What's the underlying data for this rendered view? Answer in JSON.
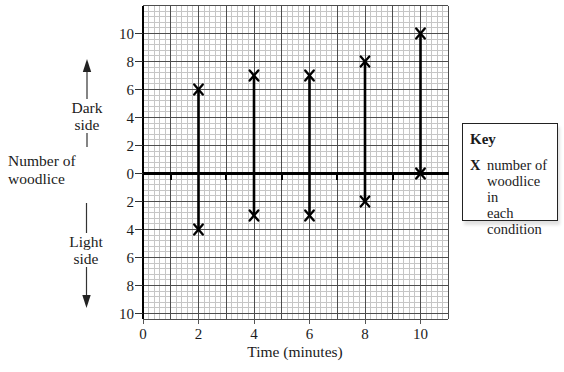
{
  "labels": {
    "y_axis_title_line1": "Number of",
    "y_axis_title_line2": "woodlice",
    "dark_line1": "Dark",
    "dark_line2": "side",
    "light_line1": "Light",
    "light_line2": "side",
    "x_axis_title": "Time (minutes)"
  },
  "key": {
    "title": "Key",
    "symbol": "X",
    "label": "number of woodlice in each condition",
    "label_lines": [
      "number of",
      "woodlice in",
      "each",
      "condition"
    ]
  },
  "chart_data": {
    "type": "scatter",
    "marker": "X",
    "xlabel": "Time (minutes)",
    "ylabel": "Number of woodlice",
    "axis_direction_labels": {
      "up": "Dark side",
      "down": "Light side"
    },
    "x_tick_labels": [
      "0",
      "2",
      "4",
      "6",
      "8",
      "10"
    ],
    "x_tick_values": [
      0,
      2,
      4,
      6,
      8,
      10
    ],
    "y_tick_labels": [
      "10",
      "8",
      "6",
      "4",
      "2",
      "0",
      "2",
      "4",
      "6",
      "8",
      "10"
    ],
    "y_tick_values": [
      10,
      8,
      6,
      4,
      2,
      0,
      -2,
      -4,
      -6,
      -8,
      -10
    ],
    "x_minor_axis_ticks": [
      1,
      3,
      5,
      7,
      9
    ],
    "xlim": [
      0,
      11
    ],
    "ylim": [
      -10.4,
      12
    ],
    "grid": "fine graph paper; major lines every 1 minute and every 2 woodlice",
    "legend_position": "right",
    "x": [
      2,
      4,
      6,
      8,
      10
    ],
    "series": [
      {
        "name": "dark side (plotted above zero)",
        "values": [
          6,
          7,
          7,
          8,
          10
        ]
      },
      {
        "name": "light side (plotted below zero)",
        "values": [
          4,
          3,
          3,
          2,
          0
        ]
      }
    ]
  },
  "colors": {
    "ink": "#1b1b1b",
    "grid_fine": "#c6c6c6",
    "grid_major": "#4d4d4d",
    "axis": "#000000"
  }
}
